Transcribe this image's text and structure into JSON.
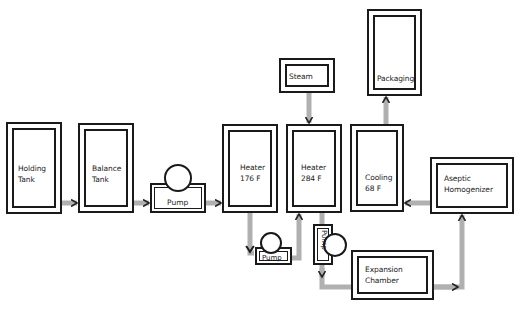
{
  "diagram": {
    "colors": {
      "line": "#1a1a1a",
      "flow": "#b0b0b0",
      "arrowhead": "#222222",
      "background": "#ffffff"
    },
    "nodes": [
      {
        "id": "holding_tank",
        "label_lines": [
          "Holding",
          "Tank"
        ]
      },
      {
        "id": "balance_tank",
        "label_lines": [
          "Balance",
          "Tank"
        ]
      },
      {
        "id": "pump_1",
        "label": "Pump"
      },
      {
        "id": "heater_176",
        "label_lines": [
          "Heater",
          "176 F"
        ]
      },
      {
        "id": "pump_2",
        "label": "Pump"
      },
      {
        "id": "heater_284",
        "label_lines": [
          "Heater",
          "284 F"
        ]
      },
      {
        "id": "steam",
        "label": "Steam"
      },
      {
        "id": "pump_3",
        "label": "Pump"
      },
      {
        "id": "expansion_chamber",
        "label_lines": [
          "Expansion",
          "Chamber"
        ]
      },
      {
        "id": "aseptic_homogenizer",
        "label_lines": [
          "Aseptic",
          "Homogenizer"
        ]
      },
      {
        "id": "cooling",
        "label_lines": [
          "Cooling",
          "68 F"
        ]
      },
      {
        "id": "packaging",
        "label": "Packaging"
      }
    ],
    "edges": [
      {
        "from": "holding_tank",
        "to": "balance_tank"
      },
      {
        "from": "balance_tank",
        "to": "pump_1"
      },
      {
        "from": "pump_1",
        "to": "heater_176"
      },
      {
        "from": "heater_176",
        "to": "pump_2"
      },
      {
        "from": "pump_2",
        "to": "heater_284"
      },
      {
        "from": "steam",
        "to": "heater_284"
      },
      {
        "from": "heater_284",
        "to": "pump_3"
      },
      {
        "from": "pump_3",
        "to": "expansion_chamber"
      },
      {
        "from": "expansion_chamber",
        "to": "aseptic_homogenizer"
      },
      {
        "from": "aseptic_homogenizer",
        "to": "cooling"
      },
      {
        "from": "cooling",
        "to": "packaging"
      }
    ]
  }
}
